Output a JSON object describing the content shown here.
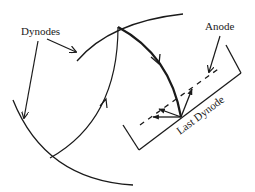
{
  "diagram": {
    "title": "",
    "labels": {
      "dynodes": "Dynodes",
      "anode": "Anode",
      "last_dynode": "Last Dynode"
    },
    "colors": {
      "stroke": "#1a1a1a",
      "background": "#ffffff"
    },
    "elements": [
      {
        "id": "dynode-upper",
        "type": "arc",
        "description": "upper curved dynode surface"
      },
      {
        "id": "dynode-lower",
        "type": "arc",
        "description": "lower-left curved dynode surface"
      },
      {
        "id": "electron-path-1",
        "type": "arrow-curve",
        "description": "electron trajectory from lower dynode to upper dynode"
      },
      {
        "id": "electron-path-2",
        "type": "arrow-curve",
        "description": "electron trajectory from upper dynode to last dynode (bold)"
      },
      {
        "id": "last-dynode",
        "type": "bracket",
        "description": "last dynode plate"
      },
      {
        "id": "anode",
        "type": "dashed-line",
        "description": "anode grid"
      },
      {
        "id": "secondary-electrons",
        "type": "arrows",
        "description": "secondary electrons emitted from last dynode"
      }
    ]
  }
}
